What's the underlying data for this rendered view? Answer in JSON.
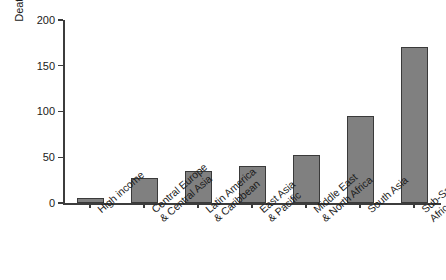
{
  "chart_data": {
    "type": "bar",
    "title": "",
    "xlabel": "",
    "ylabel": "Deaths Before the 5th Birthday (per 1000 Live Births)",
    "ylabel_lines": [
      "Deaths Before the 5th Birthday",
      "(per 1000 Live Births)"
    ],
    "categories": [
      "High income",
      "Central Europe & Central Asia",
      "Latin America & Caribbean",
      "East Asia & Pacific",
      "Middle East & North Africa",
      "South Asia",
      "Sub-Saharan Africa"
    ],
    "category_lines": [
      [
        "High income",
        ""
      ],
      [
        "Central Europe",
        "& Central Asia"
      ],
      [
        "Latin America",
        "& Caribbean"
      ],
      [
        "East Asia",
        "& Pacific"
      ],
      [
        "Middle East",
        "& North Africa"
      ],
      [
        "South Asia",
        ""
      ],
      [
        "Sub-Saharan",
        "Africa"
      ]
    ],
    "values": [
      6,
      27,
      35,
      41,
      52,
      95,
      170
    ],
    "ylim": [
      0,
      200
    ],
    "yticks": [
      0,
      50,
      100,
      150,
      200
    ],
    "ytick_labels": [
      "0",
      "50",
      "100",
      "150",
      "200"
    ],
    "grid": false,
    "legend": false,
    "bar_color": "#808080",
    "bar_edge_color": "#3a3a3a",
    "axis_color": "#3c3c3c"
  }
}
